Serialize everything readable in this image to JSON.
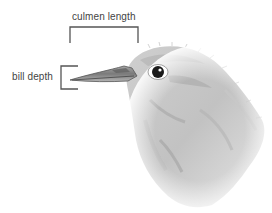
{
  "diagram": {
    "labels": {
      "culmen_length": "culmen length",
      "bill_depth": "bill depth"
    },
    "colors": {
      "bracket": "#555555",
      "text": "#444444",
      "feather_light": "#d8d8d8",
      "feather_mid": "#bdbdbd",
      "feather_dark": "#9a9a9a",
      "beak": "#8a8a8a",
      "eye": "#1a1a1a"
    }
  }
}
